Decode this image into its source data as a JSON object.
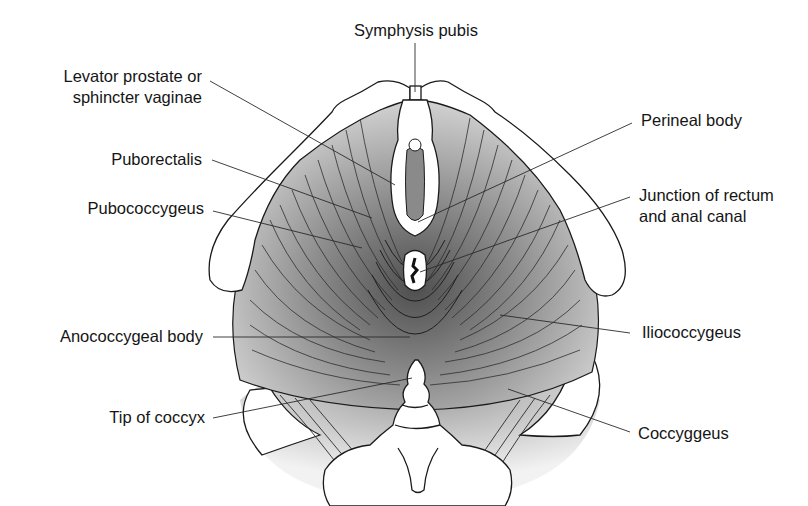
{
  "figure": {
    "type": "anatomical-diagram",
    "colors": {
      "background": "#ffffff",
      "line": "#1a1a1a",
      "muscle_dark": "#5a5a5a",
      "muscle_light": "#d8d8d8",
      "bone": "#ffffff"
    }
  },
  "labels": {
    "symphysis_pubis": "Symphysis pubis",
    "levator_prostate_l1": "Levator prostate or",
    "levator_prostate_l2": "sphincter vaginae",
    "puborectalis": "Puborectalis",
    "pubococcygeus": "Pubococcygeus",
    "anococcygeal_body": "Anococcygeal body",
    "tip_of_coccyx": "Tip of coccyx",
    "perineal_body": "Perineal body",
    "junction_l1": "Junction of rectum",
    "junction_l2": "and anal canal",
    "iliococcygeus": "Iliococcygeus",
    "coccygeus": "Coccyggeus"
  }
}
